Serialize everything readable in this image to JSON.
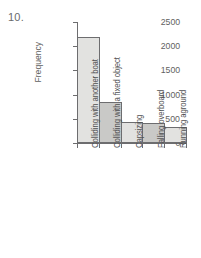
{
  "figure": {
    "item_number": "10."
  },
  "chart_data": {
    "type": "bar",
    "title": "",
    "xlabel": "",
    "ylabel": "Frequency",
    "categories": [
      "Colliding with another boat",
      "Colliding with a fixed object",
      "Capsizing",
      "Falling overboard",
      "Running aground"
    ],
    "values": [
      2200,
      840,
      440,
      410,
      330
    ],
    "ylim": [
      0,
      2500
    ],
    "yticks": [
      0,
      500,
      1000,
      1500,
      2000,
      2500
    ],
    "ytick_labels": [
      "0",
      "500",
      "1000",
      "1500",
      "2000",
      "2500"
    ],
    "grid": false,
    "legend": null,
    "bar_colors": [
      "#e2e2e0",
      "#c9c9c7",
      "#e2e2e0",
      "#c9c9c7",
      "#e2e2e0"
    ],
    "bar_edge_color": "#6d6d6f",
    "axis_color": "#6d6d6f"
  }
}
